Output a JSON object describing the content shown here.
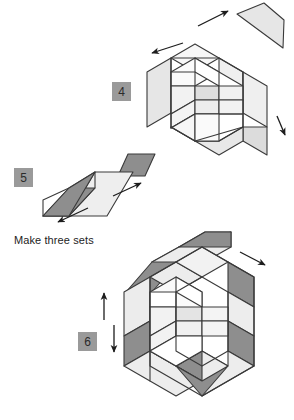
{
  "document": {
    "type": "quilting-assembly-diagram",
    "title": "Hexagon patchwork assembly steps 4-6"
  },
  "palette": {
    "white": "#ffffff",
    "light_gray": "#f0f0f0",
    "mid_gray": "#e2e2e2",
    "dark_gray": "#8e8e8e",
    "outline": "#3a3a3a",
    "badge_bg": "#9a9a9a",
    "badge_text": "#2b2b2b",
    "arrow": "#1d1d1d",
    "caption_text": "#1d1d1d"
  },
  "steps": [
    {
      "number": "4",
      "badge_label": "4",
      "name": "step-4",
      "description": "Hexagon block with side units being attached",
      "arrows": [
        {
          "name": "arrow-up-right",
          "direction": "up-right"
        },
        {
          "name": "arrow-down-left",
          "direction": "down-left"
        },
        {
          "name": "arrow-down-right",
          "direction": "down-right"
        }
      ]
    },
    {
      "number": "5",
      "badge_label": "5",
      "name": "step-5",
      "description": "Strip unit with dark diamond being joined",
      "caption": "Make three sets",
      "arrows": [
        {
          "name": "arrow-up-right",
          "direction": "up-right"
        },
        {
          "name": "arrow-down-left",
          "direction": "down-left"
        }
      ]
    },
    {
      "number": "6",
      "badge_label": "6",
      "name": "step-6",
      "description": "Large hexagon with outer ring and detached strip set",
      "arrows": [
        {
          "name": "arrow-down-right",
          "direction": "down-right"
        },
        {
          "name": "arrow-up",
          "direction": "up"
        },
        {
          "name": "arrow-down",
          "direction": "down"
        }
      ]
    }
  ],
  "captions": {
    "make_three_sets": "Make three sets"
  }
}
